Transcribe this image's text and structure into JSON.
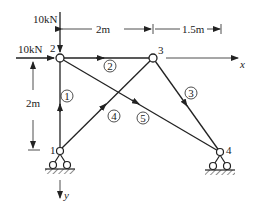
{
  "diagram": {
    "type": "plane truss",
    "loads": [
      {
        "node": "2",
        "direction": "down",
        "label": "10kN"
      },
      {
        "node": "2",
        "direction": "right",
        "label": "10kN"
      }
    ],
    "dimensions": {
      "horizontal_1": "2m",
      "horizontal_2": "1.5m",
      "vertical": "2m"
    },
    "axes": {
      "x": "x",
      "y": "y"
    },
    "nodes": [
      {
        "id": "1",
        "label": "1"
      },
      {
        "id": "2",
        "label": "2"
      },
      {
        "id": "3",
        "label": "3"
      },
      {
        "id": "4",
        "label": "4"
      }
    ],
    "members": [
      {
        "id": "1",
        "label": "①",
        "from": "1",
        "to": "2"
      },
      {
        "id": "2",
        "label": "②",
        "from": "2",
        "to": "3"
      },
      {
        "id": "3",
        "label": "③",
        "from": "3",
        "to": "4"
      },
      {
        "id": "4",
        "label": "④",
        "from": "1",
        "to": "3"
      },
      {
        "id": "5",
        "label": "⑤",
        "from": "2",
        "to": "4"
      }
    ],
    "supports": [
      {
        "node": "1",
        "type": "pin"
      },
      {
        "node": "4",
        "type": "pin"
      }
    ]
  }
}
